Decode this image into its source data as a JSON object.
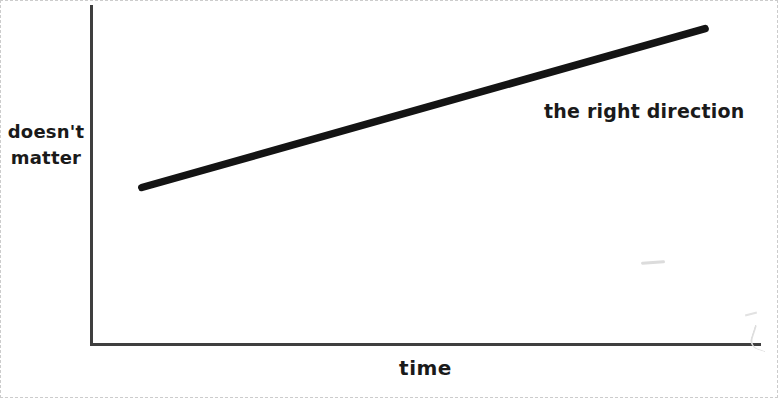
{
  "canvas": {
    "bg": "#ffffff",
    "border_color": "#cccccc",
    "axis_color": "#3f3f3f",
    "line_color": "#141414",
    "text_color": "#1a1a1a"
  },
  "chart_data": {
    "type": "line",
    "title": "",
    "xlabel": "time",
    "ylabel": "doesn't matter",
    "annotation": "the right direction",
    "x_ticks": [],
    "y_ticks": [],
    "grid": false,
    "legend": "none",
    "axis_style": "hand-drawn, no tick marks, no numeric scale",
    "series": [
      {
        "name": "trend",
        "description": "single straight upward-sloping thick black line",
        "points_frac": [
          [
            0.073,
            0.46
          ],
          [
            0.915,
            0.93
          ]
        ]
      }
    ]
  }
}
